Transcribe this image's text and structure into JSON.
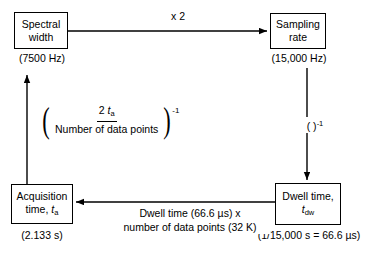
{
  "diagram": {
    "nodes": {
      "spectral_width": {
        "label_line1": "Spectral",
        "label_line2": "width",
        "caption": "(7500 Hz)"
      },
      "sampling_rate": {
        "label_line1": "Sampling",
        "label_line2": "rate",
        "caption": "(15,000 Hz)"
      },
      "acquisition_time": {
        "label_line1": "Acquisition",
        "label_line2_prefix": "time, ",
        "label_line2_var": "t",
        "label_line2_sub": "a",
        "caption": "(2.133 s)"
      },
      "dwell_time": {
        "label_line1": "Dwell time,",
        "label_line2_var": "t",
        "label_line2_sub": "dw",
        "caption": "(1/15,000 s = 66.6 µs)"
      }
    },
    "edges": {
      "top": {
        "label": "x 2",
        "from": "spectral_width",
        "to": "sampling_rate",
        "direction": "right"
      },
      "right": {
        "label_base": "( )",
        "label_exponent": "-1",
        "from": "sampling_rate",
        "to": "dwell_time",
        "direction": "down"
      },
      "bottom": {
        "label_line1": "Dwell time (66.6 µs) x",
        "label_line2": "number of data points (32 K)",
        "from": "dwell_time",
        "to": "acquisition_time",
        "direction": "left"
      },
      "left": {
        "numerator_prefix": "2 ",
        "numerator_var": "t",
        "numerator_sub": "a",
        "denominator": "Number of data points",
        "exponent": "-1",
        "from": "acquisition_time",
        "to": "spectral_width",
        "direction": "up"
      }
    },
    "colors": {
      "stroke": "#000000",
      "background": "#ffffff"
    }
  }
}
